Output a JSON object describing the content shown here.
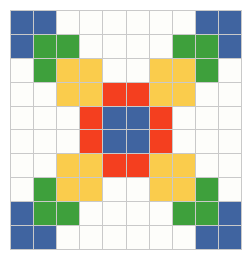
{
  "artwork": {
    "title": "Pixel Grid Pattern",
    "type": "pixel-grid",
    "columns": 10,
    "rows": 10
  },
  "palette": {
    "white": "#fdfdfa",
    "blue": "#4064a0",
    "green": "#3ea03c",
    "yellow": "#facc4c",
    "red": "#f43f1f",
    "gridline": "#c9c9c9",
    "background": "#ffffff"
  },
  "legend": [
    {
      "key": "white",
      "label": "Empty",
      "color": "#fdfdfa"
    },
    {
      "key": "blue",
      "label": "Blue",
      "color": "#4064a0"
    },
    {
      "key": "green",
      "label": "Green",
      "color": "#3ea03c"
    },
    {
      "key": "yellow",
      "label": "Yellow",
      "color": "#facc4c"
    },
    {
      "key": "red",
      "label": "Red",
      "color": "#f43f1f"
    }
  ],
  "grid": [
    [
      "blue",
      "blue",
      "white",
      "white",
      "white",
      "white",
      "white",
      "white",
      "blue",
      "blue"
    ],
    [
      "blue",
      "green",
      "green",
      "white",
      "white",
      "white",
      "white",
      "green",
      "green",
      "blue"
    ],
    [
      "white",
      "green",
      "yellow",
      "yellow",
      "white",
      "white",
      "yellow",
      "yellow",
      "green",
      "white"
    ],
    [
      "white",
      "white",
      "yellow",
      "yellow",
      "red",
      "red",
      "yellow",
      "yellow",
      "white",
      "white"
    ],
    [
      "white",
      "white",
      "white",
      "red",
      "blue",
      "blue",
      "red",
      "white",
      "white",
      "white"
    ],
    [
      "white",
      "white",
      "white",
      "red",
      "blue",
      "blue",
      "red",
      "white",
      "white",
      "white"
    ],
    [
      "white",
      "white",
      "yellow",
      "yellow",
      "red",
      "red",
      "yellow",
      "yellow",
      "white",
      "white"
    ],
    [
      "white",
      "green",
      "yellow",
      "yellow",
      "white",
      "white",
      "yellow",
      "yellow",
      "green",
      "white"
    ],
    [
      "blue",
      "green",
      "green",
      "white",
      "white",
      "white",
      "white",
      "green",
      "green",
      "blue"
    ],
    [
      "blue",
      "blue",
      "white",
      "white",
      "white",
      "white",
      "white",
      "white",
      "blue",
      "blue"
    ]
  ]
}
